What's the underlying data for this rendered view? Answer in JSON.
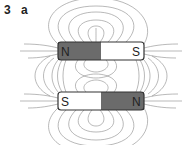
{
  "figure": {
    "number": "3",
    "part": "a"
  },
  "magnets": [
    {
      "left_pole": "N",
      "right_pole": "S",
      "left_color": "#6b6b6b",
      "right_color": "#ffffff"
    },
    {
      "left_pole": "S",
      "right_pole": "N",
      "left_color": "#ffffff",
      "right_color": "#6b6b6b"
    }
  ],
  "colors": {
    "field_line": "#8a8a8a",
    "magnet_border": "#333333",
    "text": "#222222"
  }
}
